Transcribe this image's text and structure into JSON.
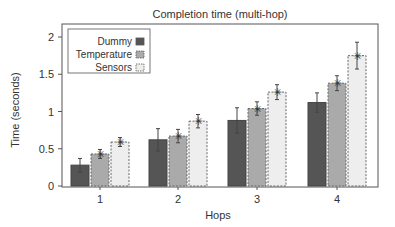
{
  "chart_data": {
    "type": "bar",
    "title": "Completion time (multi-hop)",
    "xlabel": "Hops",
    "ylabel": "Time (seconds)",
    "categories": [
      "1",
      "2",
      "3",
      "4"
    ],
    "ylim": [
      0,
      2.2
    ],
    "yticks": [
      "0",
      "0.5",
      "1",
      "1.5",
      "2"
    ],
    "grid": false,
    "legend_position": "upper-left",
    "series": [
      {
        "name": "Dummy",
        "values": [
          0.28,
          0.62,
          0.88,
          1.12
        ],
        "err": [
          0.09,
          0.15,
          0.17,
          0.13
        ],
        "color": "#555555",
        "style": "solid"
      },
      {
        "name": "Temperature",
        "values": [
          0.43,
          0.67,
          1.04,
          1.38
        ],
        "err": [
          0.06,
          0.09,
          0.09,
          0.1
        ],
        "color": "#aaaaaa",
        "style": "dotted"
      },
      {
        "name": "Sensors",
        "values": [
          0.59,
          0.87,
          1.26,
          1.75
        ],
        "err": [
          0.06,
          0.09,
          0.1,
          0.18
        ],
        "color": "#eeeeee",
        "style": "dotted"
      }
    ]
  }
}
